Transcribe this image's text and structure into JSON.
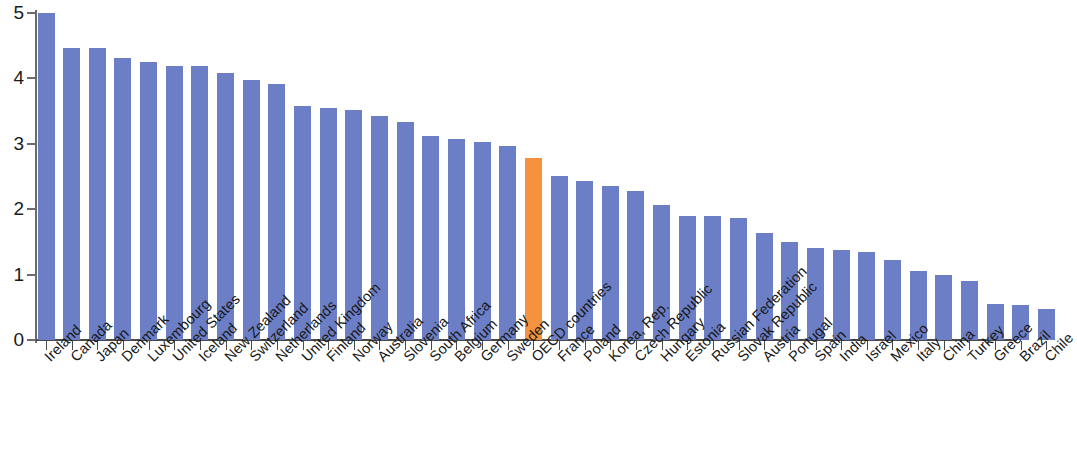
{
  "chart_data": {
    "type": "bar",
    "title": "",
    "subtitle": "",
    "xlabel": "",
    "ylabel": "",
    "ylim": [
      0,
      5
    ],
    "yticks": [
      0,
      1,
      2,
      3,
      4,
      5
    ],
    "ytick_labels": [
      "0",
      "1",
      "2",
      "3",
      "4",
      "5"
    ],
    "grid": false,
    "legend": null,
    "bar_color": "#6c7fc6",
    "highlight_color": "#f5923e",
    "highlight_category": "OECD countries",
    "categories": [
      "Ireland",
      "Canada",
      "Japan",
      "Denmark",
      "Luxembourg",
      "United States",
      "Iceland",
      "New Zealand",
      "Switzerland",
      "Netherlands",
      "United Kingdom",
      "Finland",
      "Norway",
      "Australia",
      "Slovenia",
      "South Africa",
      "Belgium",
      "Germany",
      "Sweden",
      "OECD countries",
      "France",
      "Poland",
      "Korea, Rep.",
      "Czech Republic",
      "Hungary",
      "Estonia",
      "Russian Federation",
      "Slovak Republic",
      "Austria",
      "Portugal",
      "Spain",
      "India",
      "Israel",
      "Mexico",
      "Italy",
      "China",
      "Turkey",
      "Greece",
      "Brazil",
      "Chile"
    ],
    "values": [
      5.0,
      4.46,
      4.46,
      4.31,
      4.25,
      4.19,
      4.19,
      4.08,
      3.97,
      3.92,
      3.58,
      3.55,
      3.52,
      3.43,
      3.34,
      3.12,
      3.08,
      3.03,
      2.97,
      2.78,
      2.51,
      2.43,
      2.35,
      2.28,
      2.07,
      1.9,
      1.89,
      1.86,
      1.64,
      1.5,
      1.41,
      1.38,
      1.34,
      1.22,
      1.06,
      1.0,
      0.91,
      0.55,
      0.54,
      0.48
    ]
  }
}
